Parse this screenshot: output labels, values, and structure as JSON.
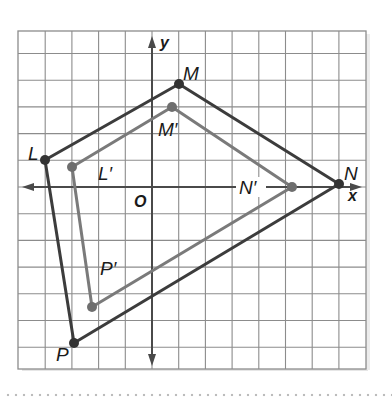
{
  "diagram": {
    "axes": {
      "x_label": "x",
      "y_label": "y",
      "origin_label": "O"
    },
    "grid": {
      "x_min": -5,
      "x_max": 8,
      "y_min": -7,
      "y_max": 6,
      "unit": 1
    },
    "colors": {
      "grid": "#8c8c8c",
      "axis": "#4a4a4a",
      "original": "#3c3c3c",
      "image": "#7a7a7a",
      "text": "#1a1a1a",
      "dots": "#bcbcbc"
    },
    "original": {
      "name": "LMNP",
      "vertices": [
        {
          "label": "L",
          "x": -4,
          "y": 1
        },
        {
          "label": "M",
          "x": 1,
          "y": 4
        },
        {
          "label": "N",
          "x": 7,
          "y": 0
        },
        {
          "label": "P",
          "x": -3,
          "y": -6
        }
      ]
    },
    "image": {
      "name": "L'M'N'P'",
      "vertices": [
        {
          "label": "L'",
          "x": -3,
          "y": 0.75
        },
        {
          "label": "M'",
          "x": 0.75,
          "y": 3
        },
        {
          "label": "N'",
          "x": 5.25,
          "y": 0
        },
        {
          "label": "P'",
          "x": -2.25,
          "y": -4.5
        }
      ]
    },
    "labels": {
      "L": "L",
      "M": "M",
      "N": "N",
      "P": "P",
      "L_prime": "L′",
      "M_prime": "M′",
      "N_prime": "N′",
      "P_prime": "P′",
      "x": "x",
      "y": "y",
      "O": "O"
    }
  }
}
